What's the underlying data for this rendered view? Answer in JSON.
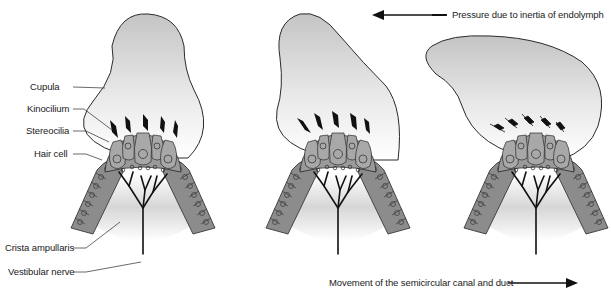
{
  "labels": {
    "cupula": "Cupula",
    "kinocilium": "Kinocilium",
    "stereocilia": "Stereocilia",
    "hair_cell": "Hair cell",
    "crista_ampullaris": "Crista ampullaris",
    "vestibular_nerve": "Vestibular nerve"
  },
  "annotations": {
    "pressure": "Pressure due to inertia of endolymph",
    "movement": "Movement of the semicircular canal and duct"
  },
  "panels": [
    {
      "id": "rest",
      "description": "Cupula upright, cilia vertical"
    },
    {
      "id": "deflection-mid",
      "description": "Cupula deflected left, cilia bent"
    },
    {
      "id": "deflection-max",
      "description": "Cupula strongly deflected left, cilia bent further"
    }
  ],
  "colors": {
    "cupula_top": "#c8c8c8",
    "cupula_bottom": "#ffffff",
    "cell_fill": "#8c8c8c",
    "cell_fill_light": "#a6a6a6",
    "outline": "#2a2a2a",
    "cilia": "#111111",
    "nerve": "#111111"
  }
}
